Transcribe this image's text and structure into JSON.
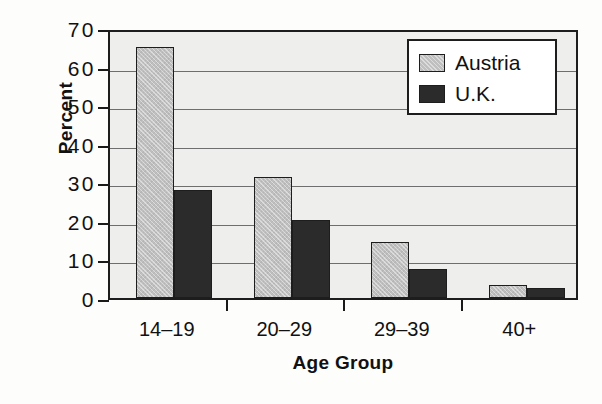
{
  "chart_data": {
    "type": "bar",
    "title": "",
    "xlabel": "Age Group",
    "ylabel": "Percent",
    "categories": [
      "14–19",
      "20–29",
      "29–39",
      "40+"
    ],
    "series": [
      {
        "name": "Austria",
        "color": "#bfbfbf",
        "values": [
          65,
          31.5,
          14.5,
          3.3
        ]
      },
      {
        "name": "U.K.",
        "color": "#2b2b2b",
        "values": [
          28,
          20.3,
          7.5,
          2.5
        ]
      }
    ],
    "ylim": [
      0,
      70
    ],
    "ytick_labels": [
      "0",
      "10",
      "20",
      "30",
      "40",
      "50",
      "60",
      "70"
    ],
    "ytick_values": [
      0,
      10,
      20,
      30,
      40,
      50,
      60,
      70
    ],
    "grid": true,
    "legend_position": "top-right",
    "plot_background": "#eeeeec",
    "axis_color": "#1d1d1d",
    "gridline_color": "#6e6e6e"
  },
  "legend": {
    "entries": [
      {
        "label": "Austria"
      },
      {
        "label": "U.K."
      }
    ]
  }
}
